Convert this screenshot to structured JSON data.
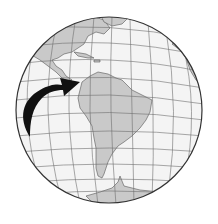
{
  "figure": {
    "description": "Orthographic globe centered on the Americas with a black curved arrow pointing to northern South America (Colombia)",
    "globe": {
      "cx": 109,
      "cy": 110,
      "r": 93
    },
    "colors": {
      "ocean": "#f4f4f4",
      "land": "#c9c9c9",
      "graticule": "#6e6e6e",
      "outline": "#333333",
      "arrow": "#111111"
    },
    "arrow": {
      "points_to": "northern South America"
    }
  }
}
